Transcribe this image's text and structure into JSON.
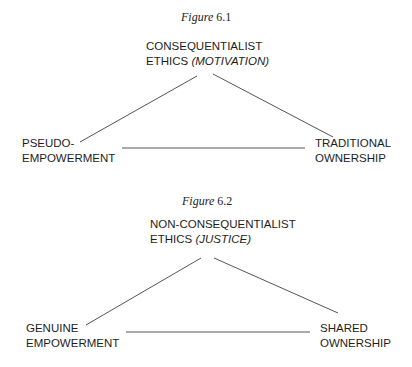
{
  "figures": [
    {
      "caption": {
        "word": "Figure",
        "number": "6.1"
      },
      "top_node": {
        "line1": "CONSEQUENTIALIST",
        "line2_plain": "ETHICS ",
        "line2_italic": "(MOTIVATION)"
      },
      "left_node": {
        "line1": "PSEUDO-",
        "line2": "EMPOWERMENT"
      },
      "right_node": {
        "line1": "TRADITIONAL",
        "line2": "OWNERSHIP"
      }
    },
    {
      "caption": {
        "word": "Figure",
        "number": "6.2"
      },
      "top_node": {
        "line1": "NON-CONSEQUENTIALIST",
        "line2_plain": "ETHICS ",
        "line2_italic": "(JUSTICE)"
      },
      "left_node": {
        "line1": "GENUINE",
        "line2": "EMPOWERMENT"
      },
      "right_node": {
        "line1": "SHARED",
        "line2": "OWNERSHIP"
      }
    }
  ],
  "colors": {
    "text": "#1e1e1e",
    "edge": "#555555",
    "background": "#ffffff"
  }
}
